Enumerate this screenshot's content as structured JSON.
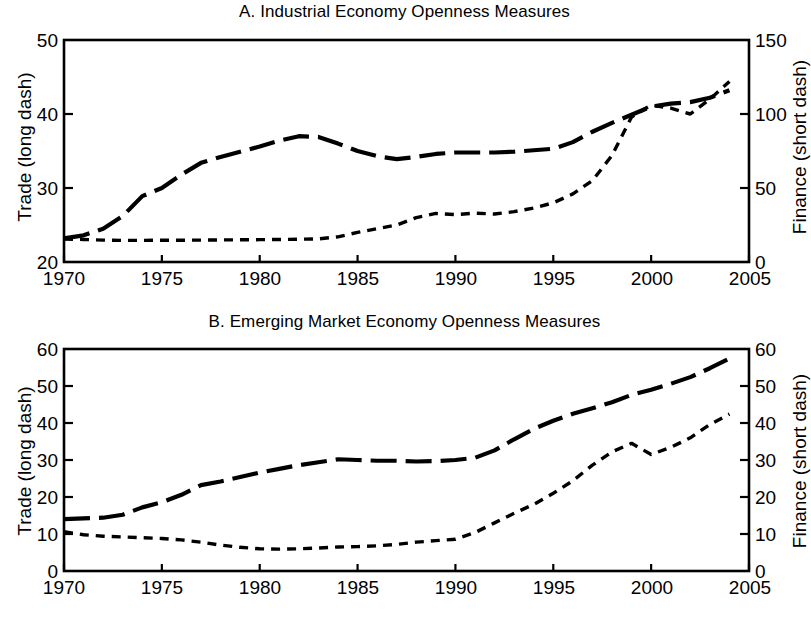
{
  "figure": {
    "background": "#ffffff",
    "ink_color": "#000000",
    "width": 809,
    "height": 618
  },
  "panels": [
    {
      "id": "A",
      "title": "A. Industrial Economy Openness Measures",
      "left_axis_title": "Trade (long dash)",
      "right_axis_title": "Finance (short dash)",
      "left_ticks": [
        "50",
        "40",
        "30",
        "20"
      ],
      "right_ticks": [
        "150",
        "100",
        "50",
        "0"
      ],
      "x_ticks": [
        "1970",
        "1975",
        "1980",
        "1985",
        "1990",
        "1995",
        "2000",
        "2005"
      ]
    },
    {
      "id": "B",
      "title": "B. Emerging Market Economy Openness Measures",
      "left_axis_title": "Trade (long dash)",
      "right_axis_title": "Finance (short dash)",
      "left_ticks": [
        "60",
        "50",
        "40",
        "30",
        "20",
        "10",
        "0"
      ],
      "right_ticks": [
        "60",
        "50",
        "40",
        "30",
        "20",
        "10",
        "0"
      ],
      "x_ticks": [
        "1970",
        "1975",
        "1980",
        "1985",
        "1990",
        "1995",
        "2000",
        "2005"
      ]
    }
  ],
  "chart_data": [
    {
      "type": "line",
      "panel": "A",
      "title": "A. Industrial Economy Openness Measures",
      "xlabel": "",
      "ylabel": "Trade (long dash)",
      "y2label": "Finance (short dash)",
      "xlim": [
        1970,
        2005
      ],
      "ylim": [
        20,
        50
      ],
      "y2lim": [
        0,
        150
      ],
      "xticks": [
        1970,
        1975,
        1980,
        1985,
        1990,
        1995,
        2000,
        2005
      ],
      "yticks": [
        20,
        30,
        40,
        50
      ],
      "y2ticks": [
        0,
        50,
        100,
        150
      ],
      "grid": false,
      "legend": "none",
      "x": [
        1970,
        1971,
        1972,
        1973,
        1974,
        1975,
        1976,
        1977,
        1978,
        1979,
        1980,
        1981,
        1982,
        1983,
        1984,
        1985,
        1986,
        1987,
        1988,
        1989,
        1990,
        1991,
        1992,
        1993,
        1994,
        1995,
        1996,
        1997,
        1998,
        1999,
        2000,
        2001,
        2002,
        2003,
        2004
      ],
      "series": [
        {
          "name": "Trade (long dash)",
          "axis": "left",
          "style": "long dash",
          "values": [
            23.2,
            23.6,
            24.5,
            26.2,
            28.9,
            30.0,
            31.8,
            33.4,
            34.2,
            34.9,
            35.6,
            36.4,
            37.0,
            36.9,
            36.0,
            35.0,
            34.3,
            33.9,
            34.2,
            34.6,
            34.8,
            34.8,
            34.8,
            34.9,
            35.1,
            35.3,
            36.2,
            37.6,
            38.8,
            39.9,
            41.0,
            41.4,
            41.6,
            42.2,
            43.2
          ]
        },
        {
          "name": "Finance (short dash)",
          "axis": "right",
          "style": "short dash",
          "values": [
            15.5,
            15.2,
            14.8,
            14.6,
            14.6,
            14.7,
            14.7,
            14.8,
            14.9,
            15.0,
            15.1,
            15.2,
            15.4,
            15.6,
            17.0,
            20.0,
            22.5,
            25.0,
            30.0,
            32.8,
            32.0,
            33.0,
            32.4,
            34.0,
            36.5,
            40.0,
            46.0,
            55.0,
            72.0,
            98.0,
            106.0,
            104.0,
            100.0,
            110.0,
            122.0
          ]
        }
      ]
    },
    {
      "type": "line",
      "panel": "B",
      "title": "B. Emerging Market Economy Openness Measures",
      "xlabel": "",
      "ylabel": "Trade (long dash)",
      "y2label": "Finance (short dash)",
      "xlim": [
        1970,
        2005
      ],
      "ylim": [
        0,
        60
      ],
      "y2lim": [
        0,
        60
      ],
      "xticks": [
        1970,
        1975,
        1980,
        1985,
        1990,
        1995,
        2000,
        2005
      ],
      "yticks": [
        0,
        10,
        20,
        30,
        40,
        50,
        60
      ],
      "y2ticks": [
        0,
        10,
        20,
        30,
        40,
        50,
        60
      ],
      "grid": false,
      "legend": "none",
      "x": [
        1970,
        1971,
        1972,
        1973,
        1974,
        1975,
        1976,
        1977,
        1978,
        1979,
        1980,
        1981,
        1982,
        1983,
        1984,
        1985,
        1986,
        1987,
        1988,
        1989,
        1990,
        1991,
        1992,
        1993,
        1994,
        1995,
        1996,
        1997,
        1998,
        1999,
        2000,
        2001,
        2002,
        2003,
        2004
      ],
      "series": [
        {
          "name": "Trade (long dash)",
          "axis": "left",
          "style": "long dash",
          "values": [
            14.0,
            14.2,
            14.4,
            15.2,
            17.2,
            18.6,
            20.6,
            23.2,
            24.2,
            25.4,
            26.6,
            27.6,
            28.6,
            29.4,
            30.2,
            30.0,
            29.8,
            29.8,
            29.6,
            29.7,
            30.0,
            30.6,
            32.6,
            35.6,
            38.4,
            40.6,
            42.5,
            44.0,
            45.6,
            47.6,
            49.0,
            50.6,
            52.4,
            54.8,
            57.4
          ]
        },
        {
          "name": "Finance (short dash)",
          "axis": "right",
          "style": "short dash",
          "values": [
            10.6,
            9.8,
            9.4,
            9.2,
            9.0,
            8.8,
            8.4,
            7.8,
            7.0,
            6.4,
            6.0,
            5.9,
            6.0,
            6.2,
            6.5,
            6.6,
            6.8,
            7.2,
            7.8,
            8.2,
            8.6,
            10.4,
            13.0,
            15.6,
            18.0,
            21.0,
            24.4,
            28.6,
            32.2,
            34.5,
            31.5,
            33.4,
            36.0,
            39.6,
            42.4
          ]
        }
      ]
    }
  ]
}
